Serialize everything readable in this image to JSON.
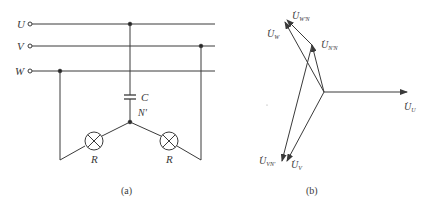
{
  "circuit": {
    "caption": "(a)",
    "terminals": [
      "U",
      "V",
      "W"
    ],
    "capacitor_label": "C",
    "neutral_label": "N'",
    "lamp_left_label": "R",
    "lamp_right_label": "R"
  },
  "phasor": {
    "caption": "(b)",
    "labels": {
      "U": {
        "main": "U",
        "sub": "U"
      },
      "W": {
        "main": "U",
        "sub": "W"
      },
      "WpN": {
        "main": "U",
        "sub": "W'N"
      },
      "NpN": {
        "main": "U",
        "sub": "N'N"
      },
      "VNp": {
        "main": "U",
        "sub": "VN'"
      },
      "V": {
        "main": "U",
        "sub": "V"
      }
    }
  },
  "colors": {
    "line": "#3a3a3a",
    "background": "#ffffff"
  }
}
